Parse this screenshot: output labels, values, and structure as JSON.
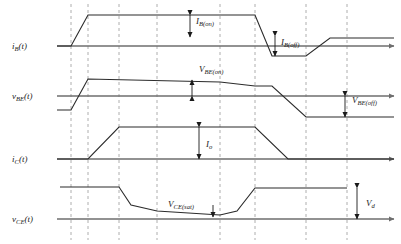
{
  "figure": {
    "colors": {
      "axis": "#6e6e6e",
      "waveform": "#2b2b2b",
      "dashed": "#9a9a9a",
      "text": "#1a1a1a",
      "background": "#ffffff"
    },
    "time_markers_x": [
      71,
      88,
      119,
      157,
      220,
      255,
      306,
      347
    ],
    "panels": [
      {
        "id": "ib",
        "axis_label": "i",
        "axis_label_sub": "B",
        "axis_label_tail": "(t)",
        "baseline_y": 46,
        "axis_x0": 57,
        "axis_x1": 394,
        "annotations": [
          {
            "name": "ib-on",
            "label": "I",
            "sub": "B(on)",
            "tail": "",
            "x": 196,
            "y": 24,
            "arrow_x": 190,
            "arrow_y0": 15,
            "arrow_y1": 37
          },
          {
            "name": "ib-off",
            "label": "I",
            "sub": "B(off)",
            "tail": "",
            "x": 281,
            "y": 45,
            "arrow_x": 275,
            "arrow_y0": 36,
            "arrow_y1": 56
          }
        ],
        "waveform": [
          [
            57,
            46
          ],
          [
            71,
            46
          ],
          [
            88,
            15
          ],
          [
            255,
            15
          ],
          [
            272,
            56
          ],
          [
            306,
            56
          ],
          [
            330,
            38
          ],
          [
            394,
            38
          ]
        ]
      },
      {
        "id": "vbe",
        "axis_label": "v",
        "axis_label_sub": "BE",
        "axis_label_tail": "(t)",
        "baseline_y": 96,
        "axis_x0": 57,
        "axis_x1": 394,
        "annotations": [
          {
            "name": "vbe-on",
            "label": "V",
            "sub": "BE(on)",
            "tail": "",
            "x": 199,
            "y": 72,
            "arrow_x": 192,
            "arrow_y0": 96,
            "arrow_y1": 80
          },
          {
            "name": "vbe-off",
            "label": "V",
            "sub": "BE(off)",
            "tail": "",
            "x": 352,
            "y": 103,
            "arrow_x": 345,
            "arrow_y0": 96,
            "arrow_y1": 117
          }
        ],
        "waveform": [
          [
            57,
            110
          ],
          [
            71,
            110
          ],
          [
            88,
            79
          ],
          [
            220,
            82
          ],
          [
            255,
            86
          ],
          [
            272,
            86
          ],
          [
            306,
            117
          ],
          [
            394,
            117
          ]
        ]
      },
      {
        "id": "ic",
        "axis_label": "i",
        "axis_label_sub": "C",
        "axis_label_tail": "(t)",
        "baseline_y": 159,
        "axis_x0": 57,
        "axis_x1": 394,
        "annotations": [
          {
            "name": "io",
            "label": "I",
            "sub": "o",
            "tail": "",
            "x": 206,
            "y": 147,
            "arrow_x": 199,
            "arrow_y0": 127,
            "arrow_y1": 159
          }
        ],
        "waveform": [
          [
            57,
            159
          ],
          [
            88,
            159
          ],
          [
            119,
            127
          ],
          [
            255,
            127
          ],
          [
            288,
            159
          ],
          [
            394,
            159
          ]
        ]
      },
      {
        "id": "vce",
        "axis_label": "v",
        "axis_label_sub": "CE",
        "axis_label_tail": "(t)",
        "baseline_y": 219,
        "axis_x0": 57,
        "axis_x1": 394,
        "annotations": [
          {
            "name": "vce-sat",
            "label": "V",
            "sub": "CE(sat)",
            "tail": "",
            "x": 168,
            "y": 207,
            "arrow_x": 213,
            "arrow_y0": 205,
            "arrow_y1": 217
          },
          {
            "name": "vd",
            "label": "V",
            "sub": "d",
            "tail": "",
            "x": 366,
            "y": 206,
            "arrow_x": 357,
            "arrow_y0": 188,
            "arrow_y1": 219
          }
        ],
        "waveform": [
          [
            60,
            187
          ],
          [
            119,
            187
          ],
          [
            131,
            205
          ],
          [
            157,
            211
          ],
          [
            220,
            215
          ],
          [
            237,
            211
          ],
          [
            255,
            188
          ],
          [
            347,
            188
          ]
        ]
      }
    ]
  }
}
